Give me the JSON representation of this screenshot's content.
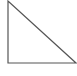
{
  "diagram": {
    "type": "right-triangle",
    "stroke_color": "#555555",
    "fill_color": "#ffffff",
    "vertices": {
      "apex": [
        8,
        1
      ],
      "right_angle": [
        8,
        63
      ],
      "base_end": [
        76,
        63
      ]
    }
  }
}
